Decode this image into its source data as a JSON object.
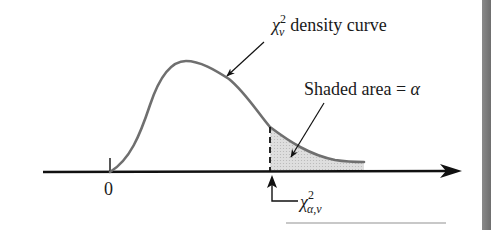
{
  "diagram": {
    "labels": {
      "curve_label_symbol": "χ",
      "curve_label_sup": "2",
      "curve_label_sub": "ν",
      "curve_label_text": "density curve",
      "shaded_label_text": "Shaded area = ",
      "shaded_label_symbol": "α",
      "zero_tick": "0",
      "critical_symbol": "χ",
      "critical_sup": "2",
      "critical_sub": "α,ν"
    },
    "colors": {
      "axis": "#111111",
      "curve": "#6f6f6f",
      "shade": "#d4d4d4",
      "arrow": "#111111",
      "edge_strip": "#7a7a7a"
    }
  }
}
